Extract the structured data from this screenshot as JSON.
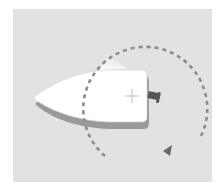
{
  "diagram": {
    "elements": [
      "boat-hull",
      "outboard-motor",
      "pivot-point",
      "turning-circle",
      "direction-arrow",
      "light-beam"
    ],
    "colors": {
      "background": "#e2e2e2",
      "hull": "#ffffff",
      "hull_shadow": "#9a9a9a",
      "turning_path": "#8c8c8c",
      "arrow": "#6e6e6e",
      "motor": "#5a5a5a"
    },
    "turn_direction": "clockwise"
  }
}
